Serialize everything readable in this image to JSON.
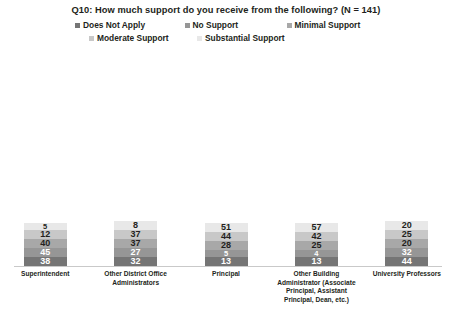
{
  "chart_data": {
    "type": "bar",
    "subtype": "stacked-bar-100",
    "title": "Q10: How much support do you receive from the following? (N = 141)",
    "xlabel": "",
    "ylabel": "",
    "grid": false,
    "legend_position": "top",
    "categories": [
      "Superintendent",
      "Other District Office Administrators",
      "Principal",
      "Other Building Administrator (Associate Principal, Assistant Principal, Dean, etc.)",
      "University Professors"
    ],
    "series": [
      {
        "name": "Does Not Apply",
        "color": "#757575",
        "values": [
          38,
          32,
          13,
          13,
          44
        ]
      },
      {
        "name": "No Support",
        "color": "#969696",
        "values": [
          45,
          27,
          5,
          4,
          32
        ]
      },
      {
        "name": "Minimal Support",
        "color": "#a8a8a8",
        "values": [
          40,
          37,
          28,
          25,
          20
        ]
      },
      {
        "name": "Moderate Support",
        "color": "#c8c8c8",
        "values": [
          12,
          37,
          44,
          42,
          25
        ]
      },
      {
        "name": "Substantial Support",
        "color": "#e8e8e8",
        "values": [
          5,
          8,
          51,
          57,
          20
        ]
      }
    ]
  },
  "legend": {
    "rows": [
      [
        {
          "label": "Does Not Apply",
          "color": "#757575"
        },
        {
          "label": "No Support",
          "color": "#969696"
        },
        {
          "label": "Minimal Support",
          "color": "#a8a8a8"
        }
      ],
      [
        {
          "label": "Moderate Support",
          "color": "#c8c8c8"
        },
        {
          "label": "Substantial Support",
          "color": "#e8e8e8"
        }
      ]
    ]
  }
}
